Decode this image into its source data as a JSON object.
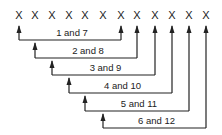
{
  "diagram": {
    "markers": [
      "X",
      "X",
      "X",
      "X",
      "X",
      "X",
      "X",
      "X",
      "X",
      "X",
      "X",
      "X"
    ],
    "pairs": [
      {
        "label": "1 and 7",
        "from": 1,
        "to": 7
      },
      {
        "label": "2 and 8",
        "from": 2,
        "to": 8
      },
      {
        "label": "3 and 9",
        "from": 3,
        "to": 9
      },
      {
        "label": "4 and 10",
        "from": 4,
        "to": 10
      },
      {
        "label": "5 and 11",
        "from": 5,
        "to": 11
      },
      {
        "label": "6 and 12",
        "from": 6,
        "to": 12
      }
    ],
    "colors": {
      "ink": "#222222",
      "background": "#ffffff"
    }
  }
}
